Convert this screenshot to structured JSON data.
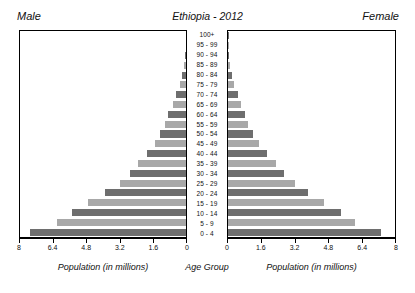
{
  "chart": {
    "title": "Ethiopia - 2012",
    "male_label": "Male",
    "female_label": "Female",
    "age_axis_title": "Age Group",
    "male_axis_title": "Population (in millions)",
    "female_axis_title": "Population (in millions)"
  },
  "chart_data": {
    "type": "bar",
    "subtype": "population-pyramid",
    "title": "Ethiopia - 2012",
    "xlabel": "Population (in millions)",
    "ylabel": "Age Group",
    "xlim": [
      0,
      8
    ],
    "xticks": [
      0,
      1.6,
      3.2,
      4.8,
      6.4,
      8
    ],
    "xtick_labels": [
      "0",
      "1.6",
      "3.2",
      "4.8",
      "6.4",
      "8"
    ],
    "left_axis_reversed": true,
    "grid": false,
    "legend": "none",
    "orientation": "horizontal",
    "bar_colors": [
      "#6e6e6e",
      "#a8a8a8"
    ],
    "bar_color_alternating": true,
    "categories": [
      "0 - 4",
      "5 - 9",
      "10 - 14",
      "15 - 19",
      "20 - 24",
      "25 - 29",
      "30 - 34",
      "35 - 39",
      "40 - 44",
      "45 - 49",
      "50 - 54",
      "55 - 59",
      "60 - 64",
      "65 - 69",
      "70 - 74",
      "75 - 79",
      "80 - 84",
      "85 - 89",
      "90 - 94",
      "95 - 99",
      "100+"
    ],
    "series": [
      {
        "name": "Male",
        "side": "left",
        "values": [
          7.5,
          6.2,
          5.5,
          4.7,
          3.9,
          3.2,
          2.7,
          2.3,
          1.9,
          1.5,
          1.25,
          1.0,
          0.85,
          0.62,
          0.47,
          0.3,
          0.18,
          0.09,
          0.04,
          0.015,
          0.005
        ]
      },
      {
        "name": "Female",
        "side": "right",
        "values": [
          7.35,
          6.1,
          5.4,
          4.6,
          3.85,
          3.2,
          2.7,
          2.3,
          1.85,
          1.5,
          1.2,
          0.98,
          0.82,
          0.6,
          0.46,
          0.3,
          0.19,
          0.1,
          0.045,
          0.018,
          0.006
        ]
      }
    ]
  }
}
